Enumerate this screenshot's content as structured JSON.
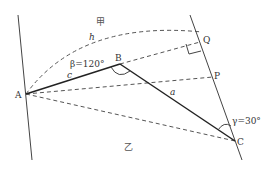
{
  "points": {
    "A": {
      "label": "A"
    },
    "B": {
      "label": "B"
    },
    "C": {
      "label": "C"
    },
    "P": {
      "label": "P"
    },
    "Q": {
      "label": "Q"
    }
  },
  "labels": {
    "side_c": "c",
    "side_a": "a",
    "height_h": "h",
    "angle_beta": "β=120°",
    "angle_gamma": "γ=30°",
    "region_top": "甲",
    "region_bottom": "乙"
  }
}
